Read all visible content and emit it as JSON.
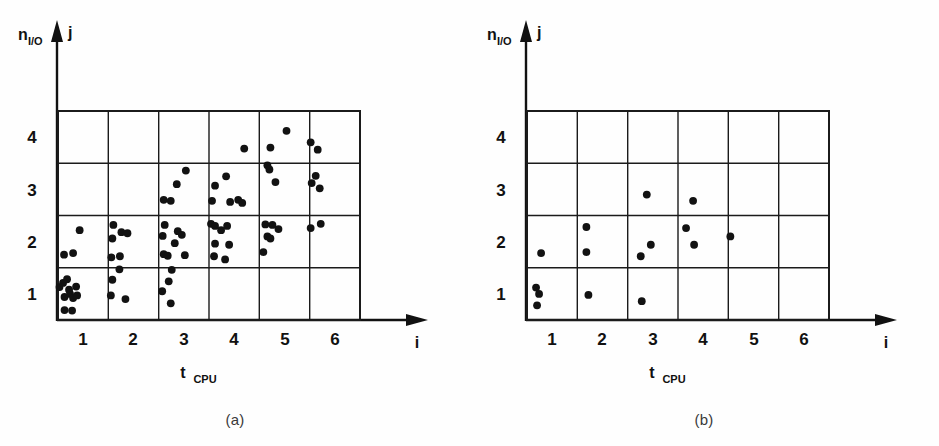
{
  "figure": {
    "title": "",
    "panels": [
      {
        "id": "a",
        "caption": "(a)"
      },
      {
        "id": "b",
        "caption": "(b)"
      }
    ]
  },
  "axis": {
    "y_label_main": "n",
    "y_label_sub": "I/O",
    "y_axis_var": "j",
    "x_label_main": "t",
    "x_label_sub": "CPU",
    "x_axis_var": "i",
    "x_ticks": [
      "1",
      "2",
      "3",
      "4",
      "5",
      "6"
    ],
    "y_ticks": [
      "1",
      "2",
      "3",
      "4"
    ]
  },
  "colors": {
    "ink": "#121212",
    "grid": "#1b1b1b",
    "background": "#fefefe"
  },
  "chart_data": [
    {
      "type": "scatter",
      "id": "a",
      "title": "(a)",
      "xlabel": "t_CPU  (i)",
      "ylabel": "n_I/O  (j)",
      "xlim": [
        0.5,
        6.5
      ],
      "ylim": [
        0.5,
        4.5
      ],
      "grid": true,
      "legend": "none",
      "cell_counts": {
        "i1_j1": 11,
        "i1_j2": 3,
        "i1_j3": 0,
        "i1_j4": 0,
        "i2_j1": 3,
        "i2_j2": 7,
        "i2_j3": 0,
        "i2_j4": 0,
        "i3_j1": 3,
        "i3_j2": 9,
        "i3_j3": 4,
        "i3_j4": 0,
        "i4_j1": 0,
        "i4_j2": 8,
        "i4_j3": 6,
        "i4_j4": 1,
        "i5_j1": 0,
        "i5_j2": 6,
        "i5_j3": 3,
        "i5_j4": 2,
        "i6_j1": 0,
        "i6_j2": 2,
        "i6_j3": 3,
        "i6_j4": 2
      },
      "points": [
        [
          0.53,
          1.13
        ],
        [
          0.6,
          1.21
        ],
        [
          0.68,
          1.28
        ],
        [
          0.63,
          0.94
        ],
        [
          0.74,
          1.0
        ],
        [
          0.8,
          0.92
        ],
        [
          0.86,
          1.14
        ],
        [
          0.63,
          0.69
        ],
        [
          0.78,
          0.68
        ],
        [
          0.72,
          1.08
        ],
        [
          0.88,
          0.97
        ],
        [
          0.62,
          1.75
        ],
        [
          0.8,
          1.78
        ],
        [
          0.93,
          2.22
        ],
        [
          1.58,
          1.27
        ],
        [
          1.55,
          0.97
        ],
        [
          1.84,
          0.9
        ],
        [
          1.6,
          2.32
        ],
        [
          1.58,
          2.06
        ],
        [
          1.56,
          1.7
        ],
        [
          1.76,
          2.18
        ],
        [
          1.88,
          2.16
        ],
        [
          1.73,
          1.72
        ],
        [
          1.72,
          1.47
        ],
        [
          2.57,
          1.05
        ],
        [
          2.7,
          1.24
        ],
        [
          2.74,
          0.82
        ],
        [
          2.62,
          2.32
        ],
        [
          2.58,
          2.11
        ],
        [
          2.6,
          1.76
        ],
        [
          2.68,
          1.73
        ],
        [
          2.82,
          1.97
        ],
        [
          2.88,
          2.2
        ],
        [
          2.96,
          2.13
        ],
        [
          3.02,
          1.74
        ],
        [
          2.76,
          1.46
        ],
        [
          2.6,
          2.8
        ],
        [
          2.74,
          2.78
        ],
        [
          2.86,
          3.1
        ],
        [
          3.04,
          3.36
        ],
        [
          3.54,
          2.34
        ],
        [
          3.62,
          2.3
        ],
        [
          3.74,
          2.22
        ],
        [
          3.86,
          2.3
        ],
        [
          3.62,
          1.96
        ],
        [
          3.9,
          1.94
        ],
        [
          3.6,
          1.72
        ],
        [
          3.82,
          1.66
        ],
        [
          3.56,
          2.78
        ],
        [
          3.62,
          3.07
        ],
        [
          3.84,
          3.25
        ],
        [
          3.92,
          2.76
        ],
        [
          4.08,
          2.8
        ],
        [
          4.16,
          2.74
        ],
        [
          4.2,
          3.78
        ],
        [
          4.58,
          1.8
        ],
        [
          4.66,
          2.1
        ],
        [
          4.62,
          2.33
        ],
        [
          4.76,
          2.32
        ],
        [
          4.88,
          2.24
        ],
        [
          4.72,
          2.06
        ],
        [
          4.7,
          3.38
        ],
        [
          4.82,
          3.14
        ],
        [
          4.66,
          3.46
        ],
        [
          4.72,
          3.8
        ],
        [
          5.04,
          4.12
        ],
        [
          5.52,
          2.26
        ],
        [
          5.72,
          2.34
        ],
        [
          5.54,
          3.12
        ],
        [
          5.62,
          3.26
        ],
        [
          5.7,
          3.02
        ],
        [
          5.52,
          3.9
        ],
        [
          5.66,
          3.76
        ]
      ]
    },
    {
      "type": "scatter",
      "id": "b",
      "title": "(b)",
      "xlabel": "t_CPU  (i)",
      "ylabel": "n_I/O  (j)",
      "xlim": [
        0.5,
        6.5
      ],
      "ylim": [
        0.5,
        4.5
      ],
      "grid": true,
      "legend": "none",
      "cell_counts": {
        "i1_j1": 3,
        "i1_j2": 1,
        "i1_j3": 0,
        "i1_j4": 0,
        "i2_j1": 1,
        "i2_j2": 2,
        "i2_j3": 0,
        "i2_j4": 0,
        "i3_j1": 1,
        "i3_j2": 2,
        "i3_j3": 1,
        "i3_j4": 0,
        "i4_j1": 0,
        "i4_j2": 2,
        "i4_j3": 1,
        "i4_j4": 0,
        "i5_j1": 0,
        "i5_j2": 1,
        "i5_j3": 0,
        "i5_j4": 0,
        "i6_j1": 0,
        "i6_j2": 0,
        "i6_j3": 0,
        "i6_j4": 0
      },
      "points": [
        [
          0.68,
          1.12
        ],
        [
          0.74,
          1.0
        ],
        [
          0.7,
          0.78
        ],
        [
          0.78,
          1.78
        ],
        [
          1.72,
          0.98
        ],
        [
          1.68,
          2.28
        ],
        [
          1.68,
          1.8
        ],
        [
          2.78,
          0.86
        ],
        [
          2.76,
          1.72
        ],
        [
          2.96,
          1.94
        ],
        [
          2.88,
          2.9
        ],
        [
          3.66,
          2.26
        ],
        [
          3.82,
          1.94
        ],
        [
          3.8,
          2.78
        ],
        [
          4.54,
          2.1
        ]
      ]
    }
  ]
}
